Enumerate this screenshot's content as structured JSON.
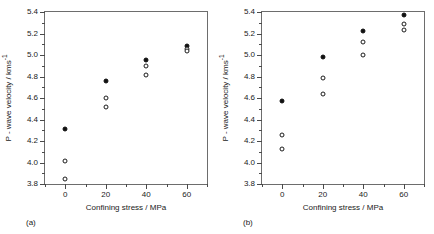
{
  "figure": {
    "background_color": "#ffffff",
    "axis_color": "#6d6d6d",
    "marker_color": "#111111"
  },
  "chart_data": [
    {
      "type": "scatter",
      "panel_label": "(a)",
      "title": "",
      "xlabel": "Confining stress / MPa",
      "ylabel": "P - wave velocity / kms",
      "ylabel_superscript": "-1",
      "xlim": [
        -10,
        70
      ],
      "ylim": [
        3.8,
        5.4
      ],
      "xticks": [
        0,
        20,
        40,
        60
      ],
      "xticklabels": [
        "0",
        "20",
        "40",
        "60"
      ],
      "yticks": [
        3.8,
        4.0,
        4.2,
        4.4,
        4.6,
        4.8,
        5.0,
        5.2,
        5.4
      ],
      "yticklabels": [
        "3.8",
        "4.0",
        "4.2",
        "4.4",
        "4.6",
        "4.8",
        "5.0",
        "5.2",
        "5.4"
      ],
      "grid": false,
      "legend": "none",
      "series": [
        {
          "name": "filled-marker",
          "marker": "filled-circle",
          "x": [
            0,
            20,
            40,
            60
          ],
          "y": [
            4.31,
            4.76,
            4.95,
            5.08
          ]
        },
        {
          "name": "open-marker-upper",
          "marker": "open-circle",
          "x": [
            0,
            20,
            40,
            60
          ],
          "y": [
            4.01,
            4.6,
            4.9,
            5.06
          ]
        },
        {
          "name": "open-marker-lower",
          "marker": "open-circle",
          "x": [
            0,
            20,
            40,
            60
          ],
          "y": [
            3.85,
            4.52,
            4.81,
            5.04
          ]
        }
      ]
    },
    {
      "type": "scatter",
      "panel_label": "(b)",
      "title": "",
      "xlabel": "Confining stress / MPa",
      "ylabel": "P - wave velocity / kms",
      "ylabel_superscript": "-1",
      "xlim": [
        -10,
        70
      ],
      "ylim": [
        3.8,
        5.4
      ],
      "xticks": [
        0,
        20,
        40,
        60
      ],
      "xticklabels": [
        "0",
        "20",
        "40",
        "60"
      ],
      "yticks": [
        3.8,
        4.0,
        4.2,
        4.4,
        4.6,
        4.8,
        5.0,
        5.2,
        5.4
      ],
      "yticklabels": [
        "3.8",
        "4.0",
        "4.2",
        "4.4",
        "4.6",
        "4.8",
        "5.0",
        "5.2",
        "5.4"
      ],
      "grid": false,
      "legend": "none",
      "series": [
        {
          "name": "filled-marker",
          "marker": "filled-circle",
          "x": [
            0,
            20,
            40,
            60
          ],
          "y": [
            4.57,
            4.98,
            5.22,
            5.37
          ]
        },
        {
          "name": "open-marker-upper",
          "marker": "open-circle",
          "x": [
            0,
            20,
            40,
            60
          ],
          "y": [
            4.26,
            4.79,
            5.12,
            5.29
          ]
        },
        {
          "name": "open-marker-lower",
          "marker": "open-circle",
          "x": [
            0,
            20,
            40,
            60
          ],
          "y": [
            4.13,
            4.64,
            5.0,
            5.23
          ]
        }
      ]
    }
  ]
}
